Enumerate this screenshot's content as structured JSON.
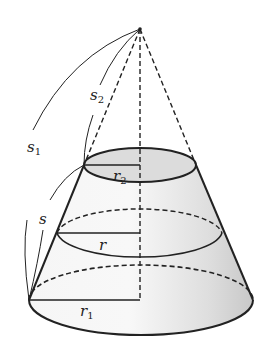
{
  "diagram": {
    "labels": {
      "s1": {
        "main": "s",
        "sub": "1"
      },
      "s2": {
        "main": "s",
        "sub": "2"
      },
      "s": {
        "main": "s",
        "sub": ""
      },
      "r1": {
        "main": "r",
        "sub": "1"
      },
      "r2": {
        "main": "r",
        "sub": "2"
      },
      "r": {
        "main": "r",
        "sub": ""
      }
    },
    "colors": {
      "stroke": "#222222",
      "fill_light": "#f2f2f2",
      "fill_dark": "#cfcfcf",
      "top_face": "#dcdcdc"
    }
  }
}
